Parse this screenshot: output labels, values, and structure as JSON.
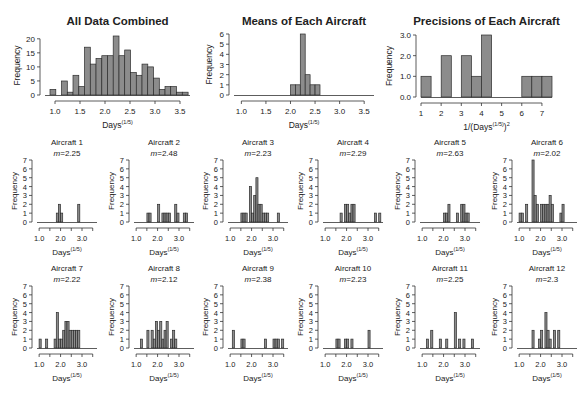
{
  "colors": {
    "bar_fill": "#8c8c8c",
    "bar_stroke": "#2b2b2b",
    "axis": "#333333",
    "text": "#222222"
  },
  "chart_data": [
    {
      "id": "all-data",
      "type": "bar",
      "title": "All Data Combined",
      "xlabel": "Days",
      "xlabel_sup": "(1/5)",
      "ylabel": "Frequency",
      "bin_start": 0.9,
      "bin_width": 0.115,
      "values": [
        2,
        0,
        5,
        1,
        7,
        3,
        17,
        11,
        13,
        14,
        14,
        21,
        14,
        16,
        8,
        7,
        11,
        10,
        6,
        2,
        3,
        3,
        1,
        1
      ],
      "xticks": [
        1.0,
        1.5,
        2.0,
        2.5,
        3.0,
        3.5
      ],
      "xtick_labels": [
        "1.0",
        "1.5",
        "2.0",
        "2.5",
        "3.0",
        "3.5"
      ],
      "yticks": [
        0,
        5,
        10,
        15,
        20
      ],
      "ytick_labels": [
        "0",
        "5",
        "10",
        "15",
        "20"
      ],
      "xlim": [
        0.8,
        3.7
      ],
      "ylim": [
        0,
        21
      ],
      "box": {
        "x": 45,
        "y": 36,
        "w": 145,
        "h": 59
      }
    },
    {
      "id": "means",
      "type": "bar",
      "title": "Means of Each Aircraft",
      "xlabel": "Days",
      "xlabel_sup": "(1/5)",
      "ylabel": "Frequency",
      "bins": [
        [
          2.0,
          1
        ],
        [
          2.1,
          1
        ],
        [
          2.2,
          6
        ],
        [
          2.3,
          2
        ],
        [
          2.4,
          1
        ],
        [
          2.5,
          1
        ]
      ],
      "bin_width": 0.1,
      "xticks": [
        1.0,
        1.5,
        2.0,
        2.5,
        3.0,
        3.5
      ],
      "xtick_labels": [
        "1.0",
        "1.5",
        "2.0",
        "2.5",
        "3.0",
        "3.5"
      ],
      "yticks": [
        0,
        1,
        2,
        3,
        4,
        5,
        6
      ],
      "ytick_labels": [
        "0",
        "1",
        "2",
        "3",
        "4",
        "5",
        "6"
      ],
      "xlim": [
        0.85,
        3.7
      ],
      "ylim": [
        0,
        6
      ],
      "box": {
        "x": 234,
        "y": 34,
        "w": 140,
        "h": 61
      }
    },
    {
      "id": "precisions",
      "type": "bar",
      "title": "Precisions of Each Aircraft",
      "xlabel": "1/(Days",
      "xlabel_sup": "(1/5)",
      "xlabel_tail": ")",
      "xlabel_tail_sup": "2",
      "ylabel": "Frequency",
      "bins": [
        [
          1.0,
          1
        ],
        [
          2.0,
          2
        ],
        [
          3.0,
          2
        ],
        [
          3.5,
          1
        ],
        [
          4.0,
          3
        ],
        [
          6.0,
          1
        ],
        [
          6.5,
          1
        ],
        [
          7.0,
          1
        ]
      ],
      "bin_width": 0.5,
      "xticks": [
        1,
        2,
        3,
        4,
        5,
        6,
        7
      ],
      "xtick_labels": [
        "1",
        "2",
        "3",
        "4",
        "5",
        "6",
        "7"
      ],
      "yticks": [
        0,
        1,
        2,
        3
      ],
      "ytick_labels": [
        "0.0",
        "1.0",
        "2.0",
        "3.0"
      ],
      "xlim": [
        1,
        7.5
      ],
      "ylim": [
        0,
        3
      ],
      "box": {
        "x": 421,
        "y": 35,
        "w": 131,
        "h": 62
      }
    }
  ],
  "aircraft_panels": [
    {
      "title": "Aircraft 1",
      "m_label": "m",
      "m_value": "=2.25",
      "bins": [
        [
          1.8,
          1
        ],
        [
          1.9,
          2
        ],
        [
          2.0,
          1
        ],
        [
          2.8,
          2
        ]
      ]
    },
    {
      "title": "Aircraft 2",
      "m_label": "m",
      "m_value": "=2.48",
      "bins": [
        [
          1.5,
          1
        ],
        [
          1.6,
          1
        ],
        [
          2.0,
          2
        ],
        [
          2.2,
          1
        ],
        [
          2.3,
          1
        ],
        [
          2.4,
          1
        ],
        [
          2.5,
          1
        ],
        [
          2.8,
          2
        ],
        [
          2.9,
          1
        ],
        [
          3.2,
          1
        ],
        [
          3.3,
          1
        ]
      ]
    },
    {
      "title": "Aircraft 3",
      "m_label": "m",
      "m_value": "=2.23",
      "bins": [
        [
          1.5,
          1
        ],
        [
          1.6,
          1
        ],
        [
          1.7,
          1
        ],
        [
          1.9,
          4
        ],
        [
          2.0,
          1
        ],
        [
          2.1,
          3
        ],
        [
          2.2,
          5
        ],
        [
          2.3,
          2
        ],
        [
          2.4,
          2
        ],
        [
          2.5,
          1
        ],
        [
          2.6,
          1
        ],
        [
          2.7,
          1
        ],
        [
          3.2,
          1
        ]
      ]
    },
    {
      "title": "Aircraft 4",
      "m_label": "m",
      "m_value": "=2.29",
      "bins": [
        [
          1.7,
          1
        ],
        [
          1.9,
          2
        ],
        [
          2.0,
          2
        ],
        [
          2.1,
          1
        ],
        [
          2.2,
          2
        ],
        [
          2.3,
          2
        ],
        [
          3.3,
          1
        ],
        [
          3.5,
          1
        ]
      ]
    },
    {
      "title": "Aircraft 5",
      "m_label": "m",
      "m_value": "=2.63",
      "bins": [
        [
          2.0,
          1
        ],
        [
          2.1,
          1
        ],
        [
          2.2,
          2
        ],
        [
          2.6,
          1
        ],
        [
          2.8,
          2
        ],
        [
          2.9,
          2
        ],
        [
          3.0,
          1
        ],
        [
          3.1,
          1
        ]
      ]
    },
    {
      "title": "Aircraft 6",
      "m_label": "m",
      "m_value": "=2.02",
      "bins": [
        [
          1.0,
          1
        ],
        [
          1.1,
          1
        ],
        [
          1.3,
          2
        ],
        [
          1.6,
          7
        ],
        [
          1.7,
          3
        ],
        [
          1.8,
          2
        ],
        [
          2.0,
          2
        ],
        [
          2.1,
          2
        ],
        [
          2.2,
          2
        ],
        [
          2.3,
          2
        ],
        [
          2.4,
          3
        ],
        [
          2.5,
          2
        ],
        [
          2.9,
          1
        ],
        [
          3.0,
          2
        ]
      ]
    },
    {
      "title": "Aircraft 7",
      "m_label": "m",
      "m_value": "=2.22",
      "bins": [
        [
          1.0,
          1
        ],
        [
          1.3,
          1
        ],
        [
          1.7,
          1
        ],
        [
          1.8,
          4
        ],
        [
          1.9,
          1
        ],
        [
          2.0,
          1
        ],
        [
          2.1,
          2
        ],
        [
          2.2,
          3
        ],
        [
          2.3,
          3
        ],
        [
          2.4,
          2
        ],
        [
          2.5,
          2
        ],
        [
          2.6,
          2
        ],
        [
          2.7,
          2
        ],
        [
          2.8,
          2
        ]
      ]
    },
    {
      "title": "Aircraft 8",
      "m_label": "m",
      "m_value": "=2.12",
      "bins": [
        [
          1.2,
          1
        ],
        [
          1.5,
          2
        ],
        [
          1.7,
          2
        ],
        [
          1.8,
          1
        ],
        [
          1.9,
          3
        ],
        [
          2.0,
          2
        ],
        [
          2.1,
          3
        ],
        [
          2.2,
          1
        ],
        [
          2.3,
          2
        ],
        [
          2.4,
          3
        ],
        [
          2.6,
          1
        ],
        [
          2.7,
          2
        ],
        [
          2.8,
          1
        ]
      ]
    },
    {
      "title": "Aircraft 9",
      "m_label": "m",
      "m_value": "=2.38",
      "bins": [
        [
          1.1,
          2
        ],
        [
          1.5,
          1
        ],
        [
          1.6,
          1
        ],
        [
          2.6,
          1
        ],
        [
          3.0,
          1
        ],
        [
          3.1,
          1
        ],
        [
          3.2,
          1
        ],
        [
          3.4,
          1
        ]
      ]
    },
    {
      "title": "Aircraft 10",
      "m_label": "m",
      "m_value": "=2.23",
      "bins": [
        [
          1.5,
          1
        ],
        [
          1.6,
          1
        ],
        [
          1.9,
          1
        ],
        [
          2.0,
          1
        ],
        [
          2.2,
          1
        ],
        [
          3.0,
          2
        ]
      ]
    },
    {
      "title": "Aircraft 11",
      "m_label": "m",
      "m_value": "=2.25",
      "bins": [
        [
          1.2,
          1
        ],
        [
          1.4,
          2
        ],
        [
          1.8,
          1
        ],
        [
          2.1,
          1
        ],
        [
          2.5,
          4
        ],
        [
          2.7,
          1
        ],
        [
          2.9,
          1
        ],
        [
          3.3,
          1
        ]
      ]
    },
    {
      "title": "Aircraft 12",
      "m_label": "m",
      "m_value": "=2.3",
      "bins": [
        [
          1.6,
          2
        ],
        [
          1.9,
          1
        ],
        [
          2.0,
          2
        ],
        [
          2.2,
          4
        ],
        [
          2.3,
          2
        ],
        [
          2.4,
          1
        ],
        [
          2.6,
          2
        ],
        [
          2.8,
          2
        ]
      ]
    }
  ],
  "aircraft_axes": {
    "xlabel": "Days",
    "xlabel_sup": "(1/5)",
    "ylabel": "Frequency",
    "bin_width": 0.1,
    "xticks": [
      1.0,
      1.5,
      2.0,
      2.5,
      3.0,
      3.5
    ],
    "xtick_labels": [
      "1.0",
      "",
      "2.0",
      "",
      "3.0",
      ""
    ],
    "yticks": [
      0,
      1,
      2,
      3,
      4,
      5,
      6,
      7
    ],
    "ytick_labels": [
      "0",
      "1",
      "2",
      "3",
      "4",
      "5",
      "6",
      "7"
    ],
    "xlim": [
      0.9,
      3.7
    ],
    "ylim": [
      0,
      7
    ]
  }
}
